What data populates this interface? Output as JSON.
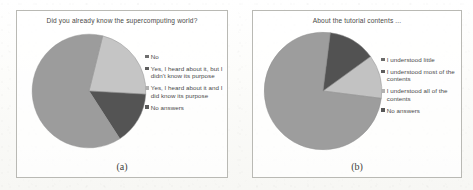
{
  "figure": {
    "panels": [
      {
        "id": "a",
        "caption": "(a)",
        "title": "Did you already know the supercomputing world?",
        "legend": [
          {
            "label": "No",
            "color": "#6f6f6f"
          },
          {
            "label": "Yes, I heard about it, but I didn't know its purpose",
            "color": "#5e5e5e"
          },
          {
            "label": "Yes, I heard about it and I did know its purpose",
            "color": "#b0b0b0"
          },
          {
            "label": "No answers",
            "color": "#5a5a5a"
          }
        ]
      },
      {
        "id": "b",
        "caption": "(b)",
        "title": "About the tutorial contents ...",
        "legend": [
          {
            "label": "I understood little",
            "color": "#6a6a6a"
          },
          {
            "label": "I understood most of the contents",
            "color": "#5e5e5e"
          },
          {
            "label": "I understood all of the contents",
            "color": "#b2b2b2"
          },
          {
            "label": "No answers",
            "color": "#585858"
          }
        ]
      }
    ]
  },
  "chart_data": [
    {
      "type": "pie",
      "title": "Did you already know the supercomputing world?",
      "panel": "(a)",
      "legend_position": "right",
      "categories": [
        "No",
        "Yes, I heard about it, but I didn't know its purpose",
        "Yes, I heard about it and I did know its purpose",
        "No answers"
      ],
      "values": [
        22,
        15,
        63,
        0
      ],
      "colors": [
        "#c6c6c6",
        "#4f4f4f",
        "#9b9b9b",
        "#7a7a7a"
      ],
      "start_angle_deg": -76,
      "notes": "Three visible wedges; 'No answers' is 0 and not drawn."
    },
    {
      "type": "pie",
      "title": "About the tutorial contents ...",
      "panel": "(b)",
      "legend_position": "right",
      "categories": [
        "I understood little",
        "I understood most of the contents",
        "I understood all of the contents",
        "No answers"
      ],
      "values": [
        12,
        75,
        13,
        0
      ],
      "colors": [
        "#c3c3c3",
        "#9c9c9c",
        "#4d4d4d",
        "#7a7a7a"
      ],
      "start_angle_deg": -36,
      "notes": "Three visible wedges; 'No answers' is 0 and not drawn."
    }
  ]
}
